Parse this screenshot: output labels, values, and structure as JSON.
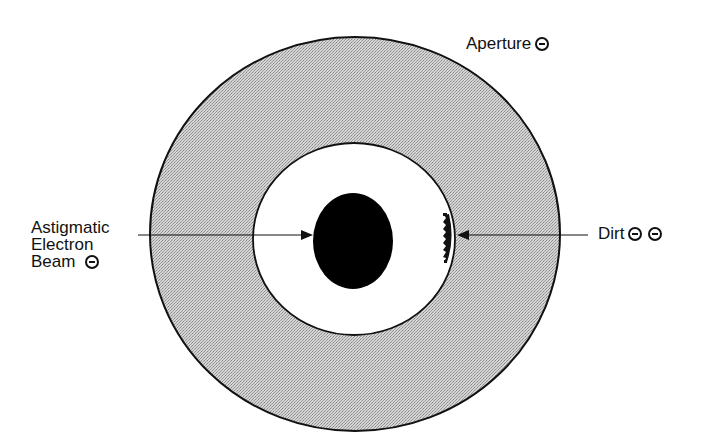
{
  "diagram": {
    "type": "aperture-astigmatism-schematic",
    "colors": {
      "background": "#ffffff",
      "aperture_fill": "#c8c8c8",
      "stroke": "#111111",
      "beam_fill": "#000000"
    },
    "labels": {
      "aperture": {
        "text": "Aperture",
        "charge_icon_count": 1
      },
      "beam": {
        "lines": [
          "Astigmatic",
          "Electron",
          "Beam"
        ],
        "charge_icon_count": 1
      },
      "dirt": {
        "text": "Dirt",
        "charge_icon_count": 2
      }
    },
    "shapes": {
      "outer_disc": {
        "cx": 355,
        "cy": 234,
        "rx": 205,
        "ry": 197
      },
      "aperture_hole": {
        "cx": 354,
        "cy": 239,
        "rx": 101,
        "ry": 96
      },
      "beam_spot": {
        "cx": 353,
        "cy": 241,
        "rx": 40,
        "ry": 48
      }
    },
    "icons": {
      "negative_charge": "circled-minus-icon"
    }
  }
}
